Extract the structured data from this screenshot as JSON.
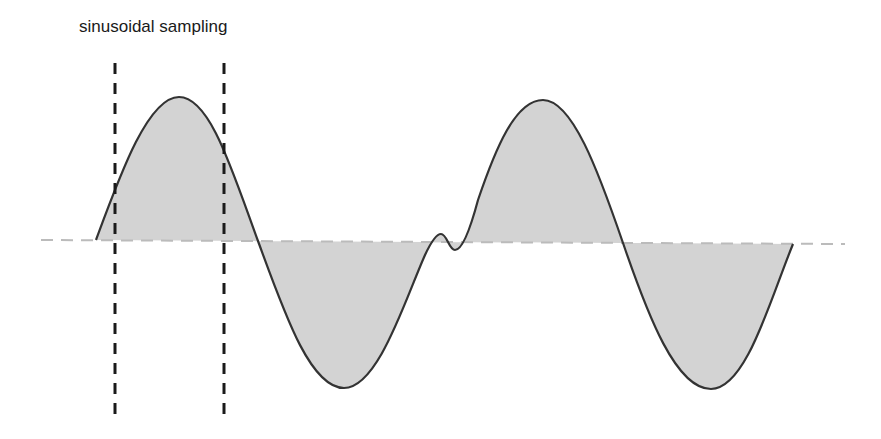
{
  "title": "sinusoidal sampling",
  "colors": {
    "curve": "#333333",
    "fill": "#d3d3d3",
    "baseline": "#bbbbbb",
    "sample_lines": "#1a1a1a",
    "text": "#1a1a1a",
    "background": "#ffffff"
  },
  "elements": {
    "baseline": {
      "style": "dashed",
      "x_start": 41,
      "x_end": 845,
      "y_left": 240,
      "y_right": 244
    },
    "sample_lines": [
      {
        "x": 115,
        "y_top": 63,
        "y_bottom": 416,
        "style": "dashed"
      },
      {
        "x": 224,
        "y_top": 63,
        "y_bottom": 416,
        "style": "dashed"
      }
    ],
    "waveform": {
      "description": "sine wave shaded between curve and baseline, with a small glitch near x=440",
      "key_points": [
        {
          "label": "start",
          "x": 96,
          "y": 240
        },
        {
          "label": "peak-1",
          "x": 179,
          "y": 97
        },
        {
          "label": "crossing-1",
          "x": 258,
          "y": 241
        },
        {
          "label": "trough-1",
          "x": 344,
          "y": 388
        },
        {
          "label": "glitch",
          "x": 440,
          "y": 242
        },
        {
          "label": "peak-2",
          "x": 543,
          "y": 100
        },
        {
          "label": "crossing-2",
          "x": 623,
          "y": 243
        },
        {
          "label": "trough-2",
          "x": 711,
          "y": 389
        },
        {
          "label": "end",
          "x": 793,
          "y": 244
        }
      ]
    }
  }
}
